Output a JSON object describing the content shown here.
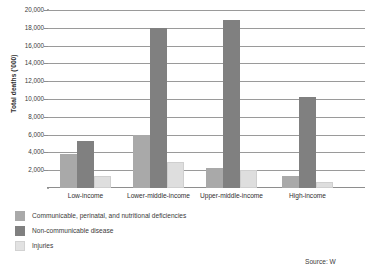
{
  "chart_data": {
    "type": "bar",
    "title": "",
    "xlabel": "",
    "ylabel": "Total deaths ('000)",
    "ylim": [
      0,
      20000
    ],
    "ytick_step": 2000,
    "grid": true,
    "legend_position": "bottom-left",
    "categories": [
      "Low-income",
      "Lower-middle-income",
      "Upper-middle-income",
      "High-income"
    ],
    "ytick_labels": [
      "20,000",
      "18,000",
      "16,000",
      "14,000",
      "12,000",
      "10,000",
      "8,000",
      "6,000",
      "4,000",
      "2,000"
    ],
    "ytick_values": [
      20000,
      18000,
      16000,
      14000,
      12000,
      10000,
      8000,
      6000,
      4000,
      2000
    ],
    "series": [
      {
        "name": "Communicable, perinatal, and nutritional deficiencies",
        "color": "#a9a9a9",
        "values": [
          3800,
          6000,
          2200,
          1400
        ]
      },
      {
        "name": "Non-communicable disease",
        "color": "#808080",
        "values": [
          5300,
          18000,
          18900,
          10200
        ]
      },
      {
        "name": "Injuries",
        "color": "#e2e2e2",
        "values": [
          1400,
          2900,
          2000,
          700
        ]
      }
    ]
  },
  "source": {
    "note": "Source: W"
  }
}
